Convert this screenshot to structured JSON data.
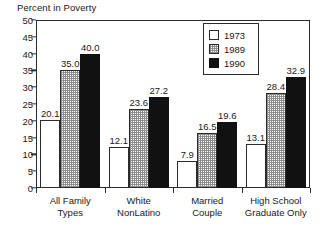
{
  "chart_data": {
    "type": "bar",
    "title": "Percent in Poverty",
    "xlabel": "",
    "ylabel": "",
    "ylim": [
      0,
      50
    ],
    "ytick_step": 5,
    "yticks": [
      50,
      45,
      40,
      35,
      30,
      25,
      20,
      15,
      10,
      5,
      0
    ],
    "grid": false,
    "legend_position": "top-center-right",
    "categories": [
      "All Family Types",
      "White NonLatino",
      "Married Couple",
      "High School Graduate Only"
    ],
    "category_lines": [
      [
        "All Family",
        "Types"
      ],
      [
        "White",
        "NonLatino"
      ],
      [
        "Married",
        "Couple"
      ],
      [
        "High School",
        "Graduate Only"
      ]
    ],
    "series": [
      {
        "name": "1973",
        "fill": "white",
        "color": "#ffffff",
        "values": [
          20.1,
          12.1,
          7.9,
          13.1
        ]
      },
      {
        "name": "1989",
        "fill": "stipple",
        "color": "#8d8d8d",
        "values": [
          35.0,
          23.6,
          16.5,
          28.4
        ]
      },
      {
        "name": "1990",
        "fill": "solid",
        "color": "#111111",
        "values": [
          40.0,
          27.2,
          19.6,
          32.9
        ]
      }
    ],
    "value_labels": [
      [
        "20.1",
        "35.0",
        "40.0"
      ],
      [
        "12.1",
        "23.6",
        "27.2"
      ],
      [
        "7.9",
        "16.5",
        "19.6"
      ],
      [
        "13.1",
        "28.4",
        "32.9"
      ]
    ]
  },
  "legend": {
    "items": [
      {
        "label": "1973"
      },
      {
        "label": "1989"
      },
      {
        "label": "1990"
      }
    ]
  }
}
